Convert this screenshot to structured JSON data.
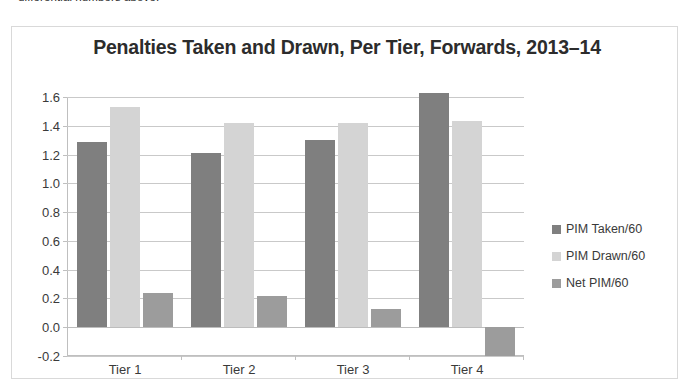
{
  "page": {
    "text_fragment_above": "differential numbers above."
  },
  "chart_panel": {
    "border_color": "#d9d9d9"
  },
  "legend": {
    "position": "right",
    "items": [
      {
        "label": "PIM Taken/60",
        "color": "#7f7f7f"
      },
      {
        "label": "PIM Drawn/60",
        "color": "#d4d4d4"
      },
      {
        "label": "Net PIM/60",
        "color": "#9c9c9c"
      }
    ]
  },
  "chart_data": {
    "type": "bar",
    "title": "Penalties Taken and Drawn, Per Tier, Forwards, 2013–14",
    "xlabel": "",
    "ylabel": "",
    "categories": [
      "Tier 1",
      "Tier 2",
      "Tier 3",
      "Tier 4"
    ],
    "series": [
      {
        "name": "PIM Taken/60",
        "color": "#7f7f7f",
        "values": [
          1.29,
          1.21,
          1.3,
          1.63
        ]
      },
      {
        "name": "PIM Drawn/60",
        "color": "#d4d4d4",
        "values": [
          1.53,
          1.42,
          1.42,
          1.43
        ]
      },
      {
        "name": "Net PIM/60",
        "color": "#9c9c9c",
        "values": [
          0.24,
          0.22,
          0.13,
          -0.2
        ]
      }
    ],
    "ylim": [
      -0.2,
      1.6
    ],
    "yticks": [
      1.6,
      1.4,
      1.2,
      1.0,
      0.8,
      0.6,
      0.4,
      0.2,
      0.0,
      -0.2
    ],
    "ytick_labels": [
      "1.6",
      "1.4",
      "1.2",
      "1.0",
      "0.8",
      "0.6",
      "0.4",
      "0.2",
      "0.0",
      "-0.2"
    ],
    "grid": true,
    "legend_position": "right"
  }
}
